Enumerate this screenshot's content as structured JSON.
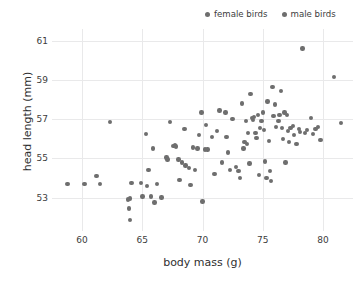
{
  "chart_data": {
    "type": "scatter",
    "title": "",
    "xlabel": "body mass (g)",
    "ylabel": "head length (mm)",
    "xlim": [
      57.5,
      82.5
    ],
    "ylim": [
      51.3,
      61.6
    ],
    "xticks": [
      60,
      65,
      70,
      75,
      80
    ],
    "yticks": [
      53,
      55,
      57,
      59,
      61
    ],
    "grid": true,
    "legend_position": "top-right",
    "marker_color": "#6e6e6e",
    "marker_size_px": 4.4,
    "series": [
      {
        "name": "female birds",
        "color": "#6e6e6e",
        "points": [
          [
            58.8,
            53.7
          ],
          [
            60.2,
            53.7
          ],
          [
            61.2,
            54.1
          ],
          [
            61.5,
            53.7
          ],
          [
            62.3,
            56.85
          ],
          [
            63.8,
            52.9
          ],
          [
            63.9,
            52.45
          ],
          [
            64.0,
            52.95
          ],
          [
            64.0,
            51.85
          ],
          [
            64.1,
            53.75
          ],
          [
            64.9,
            53.75
          ],
          [
            65.0,
            53.05
          ],
          [
            65.3,
            56.25
          ],
          [
            65.4,
            53.6
          ],
          [
            65.5,
            54.4
          ],
          [
            65.7,
            53.05
          ],
          [
            65.9,
            55.5
          ],
          [
            66.0,
            52.75
          ],
          [
            66.2,
            53.7
          ],
          [
            66.6,
            53.0
          ],
          [
            67.0,
            55.05
          ],
          [
            67.1,
            54.95
          ],
          [
            67.3,
            56.85
          ],
          [
            67.6,
            55.65
          ],
          [
            67.7,
            55.7
          ],
          [
            67.8,
            55.6
          ],
          [
            68.0,
            54.95
          ],
          [
            68.1,
            53.9
          ],
          [
            68.3,
            54.8
          ],
          [
            68.5,
            56.5
          ],
          [
            68.6,
            54.65
          ],
          [
            68.9,
            54.5
          ],
          [
            69.0,
            53.65
          ],
          [
            69.2,
            55.55
          ],
          [
            69.4,
            54.4
          ],
          [
            69.6,
            55.5
          ],
          [
            69.7,
            56.2
          ],
          [
            69.9,
            57.35
          ],
          [
            70.0,
            52.8
          ],
          [
            70.2,
            55.45
          ],
          [
            70.3,
            56.7
          ],
          [
            70.4,
            55.45
          ],
          [
            70.8,
            56.1
          ],
          [
            71.0,
            54.2
          ],
          [
            71.2,
            56.4
          ],
          [
            71.4,
            57.45
          ],
          [
            71.6,
            54.8
          ],
          [
            71.9,
            57.35
          ],
          [
            72.0,
            56.1
          ],
          [
            72.1,
            55.3
          ],
          [
            72.3,
            54.4
          ],
          [
            72.5,
            57.0
          ],
          [
            72.8,
            54.55
          ],
          [
            73.0,
            54.35
          ],
          [
            73.1,
            54.0
          ],
          [
            73.3,
            57.8
          ]
        ]
      },
      {
        "name": "male birds",
        "color": "#6e6e6e",
        "points": [
          [
            73.4,
            55.5
          ],
          [
            73.5,
            55.85
          ],
          [
            73.6,
            56.9
          ],
          [
            73.7,
            55.75
          ],
          [
            73.8,
            56.3
          ],
          [
            73.9,
            54.75
          ],
          [
            74.0,
            58.3
          ],
          [
            74.1,
            57.05
          ],
          [
            74.2,
            56.95
          ],
          [
            74.3,
            57.1
          ],
          [
            74.4,
            56.3
          ],
          [
            74.5,
            56.05
          ],
          [
            74.6,
            57.2
          ],
          [
            74.7,
            54.15
          ],
          [
            74.8,
            56.55
          ],
          [
            74.9,
            56.9
          ],
          [
            75.0,
            57.35
          ],
          [
            75.1,
            56.45
          ],
          [
            75.2,
            54.85
          ],
          [
            75.3,
            54.0
          ],
          [
            75.4,
            57.9
          ],
          [
            75.5,
            55.9
          ],
          [
            75.6,
            54.35
          ],
          [
            75.7,
            53.85
          ],
          [
            75.8,
            58.65
          ],
          [
            75.9,
            57.15
          ],
          [
            76.0,
            57.75
          ],
          [
            76.1,
            56.6
          ],
          [
            76.3,
            56.9
          ],
          [
            76.4,
            57.2
          ],
          [
            76.5,
            58.45
          ],
          [
            76.6,
            56.55
          ],
          [
            76.7,
            56.0
          ],
          [
            76.8,
            57.35
          ],
          [
            76.9,
            54.8
          ],
          [
            77.0,
            57.2
          ],
          [
            77.1,
            56.4
          ],
          [
            77.2,
            55.85
          ],
          [
            77.3,
            56.55
          ],
          [
            77.5,
            56.65
          ],
          [
            77.6,
            56.2
          ],
          [
            77.8,
            55.75
          ],
          [
            78.0,
            56.5
          ],
          [
            78.1,
            56.35
          ],
          [
            78.3,
            60.6
          ],
          [
            78.5,
            56.3
          ],
          [
            78.7,
            56.45
          ],
          [
            79.0,
            57.05
          ],
          [
            79.2,
            56.25
          ],
          [
            79.4,
            56.5
          ],
          [
            79.6,
            56.6
          ],
          [
            79.8,
            55.95
          ],
          [
            80.9,
            59.15
          ],
          [
            81.5,
            56.8
          ]
        ]
      }
    ]
  }
}
